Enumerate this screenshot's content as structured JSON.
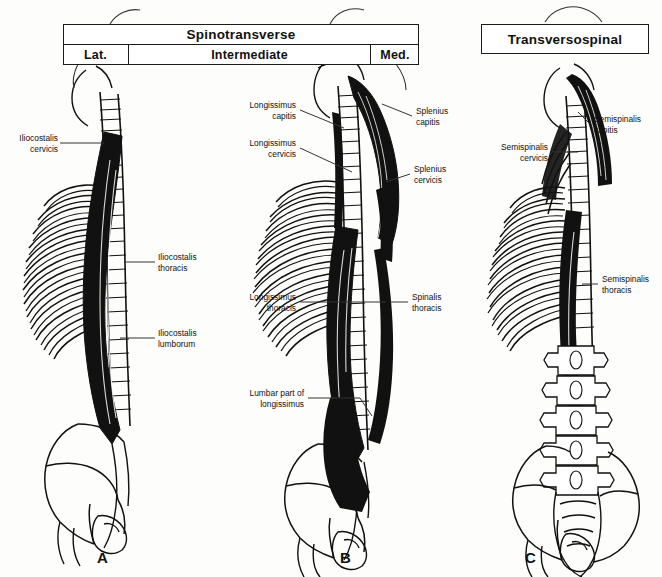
{
  "figure": {
    "title_left": "Spinotransverse",
    "title_right": "Transversospinal",
    "subcells": [
      "Lat.",
      "Intermediate",
      "Med."
    ],
    "panel_letters": [
      "A",
      "B",
      "C"
    ],
    "caption": ""
  },
  "panel_a": {
    "letter": "A",
    "labels": [
      {
        "id": "iliocostalis-cervicis",
        "text": "Iliocostalis\ncervicis",
        "align": "right"
      },
      {
        "id": "iliocostalis-thoracis",
        "text": "Iliocostalis\nthoracis",
        "align": "left"
      },
      {
        "id": "iliocostalis-lumborum",
        "text": "Iliocostalis\nlumborum",
        "align": "left"
      }
    ]
  },
  "panel_b": {
    "letter": "B",
    "labels": [
      {
        "id": "longissimus-capitis",
        "text": "Longissimus\ncapitis",
        "align": "right"
      },
      {
        "id": "longissimus-cervicis",
        "text": "Longissimus\ncervicis",
        "align": "right"
      },
      {
        "id": "splenius-capitis",
        "text": "Splenius\ncapitis",
        "align": "left"
      },
      {
        "id": "splenius-cervicis",
        "text": "Splenius\ncervicis",
        "align": "left"
      },
      {
        "id": "longissimus-thoracis",
        "text": "Longissimus\nthoracis",
        "align": "right"
      },
      {
        "id": "spinalis-thoracis",
        "text": "Spinalis\nthoracis",
        "align": "left"
      },
      {
        "id": "lumbar-part-of-longissimus",
        "text": "Lumbar part of\nlongissimus",
        "align": "right"
      }
    ]
  },
  "panel_c": {
    "letter": "C",
    "labels": [
      {
        "id": "semispinalis-capitis",
        "text": "Semispinalis\ncapitis",
        "align": "left"
      },
      {
        "id": "semispinalis-cervicis",
        "text": "Semispinalis\ncervicis",
        "align": "right"
      },
      {
        "id": "semispinalis-thoracis",
        "text": "Semispinalis\nthoracis",
        "align": "left"
      }
    ]
  },
  "colors": {
    "ink": "#111111",
    "paper": "#fdfdfb",
    "muscle_fill": "#111111"
  }
}
